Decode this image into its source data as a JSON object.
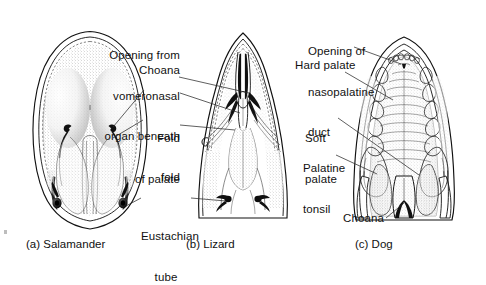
{
  "figure": {
    "background": "#ffffff",
    "ink_color": "#111111",
    "leader_color": "#2b2b2b",
    "panels": [
      {
        "id": "a",
        "caption": "(a) Salamander",
        "subject": "Salamander",
        "structures": [
          "choana",
          "fold of palate",
          "eustachian tube"
        ]
      },
      {
        "id": "b",
        "caption": "(b) Lizard",
        "subject": "Lizard",
        "structures": [
          "opening from vomeronasal organ beneath fold",
          "choana",
          "fold of palate",
          "eustachian tube"
        ]
      },
      {
        "id": "c",
        "caption": "(c) Dog",
        "subject": "Dog",
        "structures": [
          "opening of nasopalatine duct",
          "hard palate",
          "soft palate",
          "palatine tonsil",
          "choana"
        ]
      }
    ],
    "labels": [
      {
        "id": "vomeronasal",
        "lines": [
          "Opening from",
          "vomeronasal",
          "organ beneath",
          "fold"
        ],
        "text": "Opening from vomeronasal organ beneath fold"
      },
      {
        "id": "choana-left",
        "lines": [
          "Choana"
        ],
        "text": "Choana"
      },
      {
        "id": "fold-of-palate",
        "lines": [
          "Fold",
          "of palate"
        ],
        "text": "Fold of palate"
      },
      {
        "id": "eustachian-tube",
        "lines": [
          "Eustachian",
          "tube"
        ],
        "text": "Eustachian tube"
      },
      {
        "id": "nasopalatine",
        "lines": [
          "Opening of",
          "nasopalatine",
          "duct"
        ],
        "text": "Opening of nasopalatine duct"
      },
      {
        "id": "hard-palate",
        "lines": [
          "Hard palate"
        ],
        "text": "Hard palate"
      },
      {
        "id": "soft-palate",
        "lines": [
          "Soft",
          "palate"
        ],
        "text": "Soft palate"
      },
      {
        "id": "palatine-tonsil",
        "lines": [
          "Palatine",
          "tonsil"
        ],
        "text": "Palatine tonsil"
      },
      {
        "id": "choana-dog",
        "lines": [
          "Choana"
        ],
        "text": "Choana"
      }
    ],
    "captions": {
      "a": "(a) Salamander",
      "b": "(b) Lizard",
      "c": "(c) Dog"
    },
    "label_text": {
      "vomeronasal_l1": "Opening from",
      "vomeronasal_l2": "vomeronasal",
      "vomeronasal_l3": "organ beneath",
      "vomeronasal_l4": "fold",
      "choana_left": "Choana",
      "fold_l1": "Fold",
      "fold_l2": "of palate",
      "eustachian_l1": "Eustachian",
      "eustachian_l2": "tube",
      "nasopalatine_l1": "Opening of",
      "nasopalatine_l2": "nasopalatine",
      "nasopalatine_l3": "duct",
      "hard_palate": "Hard palate",
      "soft_l1": "Soft",
      "soft_l2": "palate",
      "tonsil_l1": "Palatine",
      "tonsil_l2": "tonsil",
      "choana_dog": "Choana"
    }
  }
}
